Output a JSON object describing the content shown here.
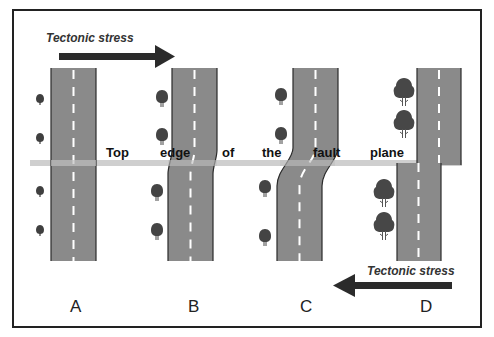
{
  "diagram": {
    "stress_top": {
      "label": "Tectonic stress",
      "direction": "right"
    },
    "stress_bottom": {
      "label": "Tectonic stress",
      "direction": "left"
    },
    "fault_caption": [
      "Top",
      "edge",
      "of",
      "the",
      "fault",
      "plane"
    ],
    "panels": [
      {
        "letter": "A",
        "description": "Straight road crossing fault, no offset"
      },
      {
        "letter": "B",
        "description": "Road slightly bent across fault"
      },
      {
        "letter": "C",
        "description": "Road strongly bent (S-curve) across fault"
      },
      {
        "letter": "D",
        "description": "Road broken and offset along fault"
      }
    ],
    "colors": {
      "road": "#8a8a8a",
      "road_edge": "#2a2a2a",
      "center_line": "#ffffff",
      "fault_line": "#cfcfcf",
      "arrow": "#2b2b2b",
      "tree": "#444444",
      "frame": "#222222"
    }
  }
}
